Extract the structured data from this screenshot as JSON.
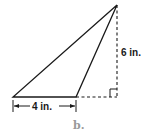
{
  "diagram": {
    "caption": "b.",
    "base_label": "4 in.",
    "height_label": "6 in.",
    "shape": "obtuse triangle with external height",
    "colors": {
      "stroke": "#1a1a1a",
      "caption": "#9a9a9a"
    }
  }
}
